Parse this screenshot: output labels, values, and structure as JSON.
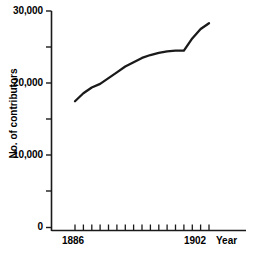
{
  "chart_data": {
    "type": "line",
    "title": "",
    "xlabel": "Year",
    "ylabel": "No. of contributors",
    "xlim": [
      1886,
      1902
    ],
    "ylim": [
      0,
      30000
    ],
    "grid": false,
    "legend": null,
    "y_ticks": [
      {
        "value": 30000,
        "label": "30,000",
        "labeled": true
      },
      {
        "value": 25000,
        "label": "",
        "labeled": false
      },
      {
        "value": 20000,
        "label": "20,000",
        "labeled": true
      },
      {
        "value": 15000,
        "label": "",
        "labeled": false
      },
      {
        "value": 10000,
        "label": "10,000",
        "labeled": true
      },
      {
        "value": 5000,
        "label": "",
        "labeled": false
      },
      {
        "value": 0,
        "label": "0",
        "labeled": true
      }
    ],
    "x_ticks": [
      {
        "value": 1886,
        "label": "1886",
        "labeled": true
      },
      {
        "value": 1887,
        "label": "",
        "labeled": false
      },
      {
        "value": 1888,
        "label": "",
        "labeled": false
      },
      {
        "value": 1889,
        "label": "",
        "labeled": false
      },
      {
        "value": 1890,
        "label": "",
        "labeled": false
      },
      {
        "value": 1891,
        "label": "",
        "labeled": false
      },
      {
        "value": 1892,
        "label": "",
        "labeled": false
      },
      {
        "value": 1893,
        "label": "",
        "labeled": false
      },
      {
        "value": 1894,
        "label": "",
        "labeled": false
      },
      {
        "value": 1895,
        "label": "",
        "labeled": false
      },
      {
        "value": 1896,
        "label": "",
        "labeled": false
      },
      {
        "value": 1897,
        "label": "",
        "labeled": false
      },
      {
        "value": 1898,
        "label": "",
        "labeled": false
      },
      {
        "value": 1899,
        "label": "",
        "labeled": false
      },
      {
        "value": 1900,
        "label": "",
        "labeled": false
      },
      {
        "value": 1901,
        "label": "",
        "labeled": false
      },
      {
        "value": 1902,
        "label": "1902",
        "labeled": true
      }
    ],
    "x": [
      1886,
      1887,
      1888,
      1889,
      1890,
      1891,
      1892,
      1893,
      1894,
      1895,
      1896,
      1897,
      1898,
      1899,
      1900,
      1901,
      1902
    ],
    "values": [
      17500,
      18600,
      19400,
      19900,
      20700,
      21500,
      22300,
      22900,
      23500,
      23900,
      24200,
      24400,
      24500,
      24500,
      26200,
      27500,
      28300
    ],
    "series": [
      {
        "name": "No. of contributors",
        "color": "#1a1a1a",
        "values": [
          17500,
          18600,
          19400,
          19900,
          20700,
          21500,
          22300,
          22900,
          23500,
          23900,
          24200,
          24400,
          24500,
          24500,
          26200,
          27500,
          28300
        ]
      }
    ]
  },
  "axis": {
    "y_label_text": "No. of contributors",
    "x_label_text": "Year",
    "y_tick_labels": [
      "30,000",
      "20,000",
      "10,000",
      "0"
    ],
    "x_tick_labels": [
      "1886",
      "1902"
    ]
  },
  "colors": {
    "line": "#1a1a1a",
    "axis": "#1a1a1a",
    "background": "#ffffff",
    "text": "#000000"
  }
}
